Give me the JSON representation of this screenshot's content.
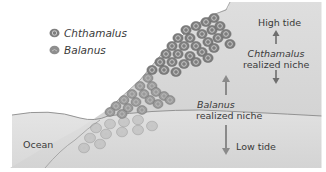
{
  "legend": {
    "items": [
      {
        "icon": "chthamalus-barnacle-icon",
        "label": "Chthamalus"
      },
      {
        "icon": "balanus-barnacle-icon",
        "label": "Balanus"
      }
    ]
  },
  "labels": {
    "high_tide": "High tide",
    "low_tide": "Low tide",
    "ocean": "Ocean",
    "chthamalus_niche": {
      "species": "Chthamalus",
      "text": "realized niche"
    },
    "balanus_niche": {
      "species": "Balanus",
      "text": "realized niche"
    }
  },
  "colors": {
    "background": "#ffffff",
    "rock": "#d9d9d9",
    "rock_dark": "#c9c9c9",
    "water_line": "#8a8a8a",
    "chthamalus": "#7e7e7e",
    "balanus": "#9a9a9a",
    "arrow": "#6e6e6e",
    "text": "#3a3a3a"
  }
}
